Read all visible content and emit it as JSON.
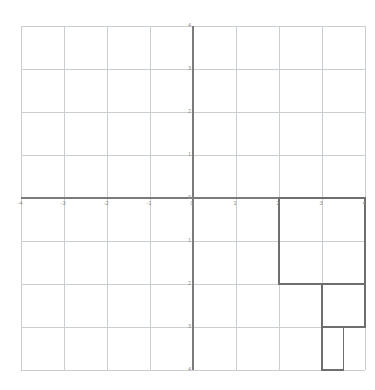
{
  "chart_data": {
    "type": "scatter",
    "title": "",
    "subtitle": "",
    "xlabel": "",
    "ylabel": "",
    "xlim": [
      -4,
      4
    ],
    "ylim": [
      -4,
      4
    ],
    "grid": true,
    "grid_step": 1,
    "legend": "none",
    "x_ticks": [
      "-4",
      "-3",
      "-2",
      "-1",
      "0",
      "1",
      "2",
      "3",
      "4"
    ],
    "x_tick_values": [
      -4,
      -3,
      -2,
      -1,
      0,
      1,
      2,
      3,
      4
    ],
    "y_ticks": [
      "4",
      "3",
      "2",
      "1",
      "0",
      "1",
      "2",
      "3",
      "4"
    ],
    "y_tick_values": [
      4,
      3,
      2,
      1,
      0,
      -1,
      -2,
      -3,
      -4
    ],
    "shapes": [
      {
        "name": "square-large",
        "kind": "rectangle",
        "x0": 2,
        "y0": 0,
        "x1": 4,
        "y1": -2,
        "width_units": 2,
        "height_units": 2
      },
      {
        "name": "square-medium",
        "kind": "rectangle",
        "x0": 3,
        "y0": -2,
        "x1": 4,
        "y1": -3,
        "width_units": 1,
        "height_units": 1
      },
      {
        "name": "square-small",
        "kind": "rectangle",
        "x0": 3,
        "y0": -3,
        "x1": 3.5,
        "y1": -4,
        "width_units": 0.5,
        "height_units": 1
      }
    ],
    "series": [],
    "values": []
  },
  "colors": {
    "background": "#ffffff",
    "gridline": "#c9ced3",
    "axis": "#7b7b7b",
    "shape_stroke": "#6e6e6e",
    "tick_text": "#8d8d8d"
  },
  "geometry": {
    "origin_x_px": 193,
    "origin_y_px": 198,
    "unit_px_x": 43,
    "unit_px_y": 43
  }
}
